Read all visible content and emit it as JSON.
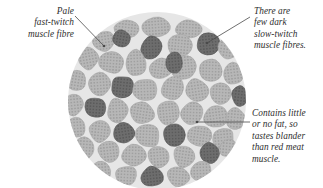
{
  "figure": {
    "kind": "micrograph-diagram",
    "background_color": "#ffffff"
  },
  "annotations": {
    "pale_fibre": {
      "text": "Pale\nfast-twitch\nmuscle fibre",
      "align": "right"
    },
    "dark_fibre": {
      "text": "There are\nfew dark\nslow-twitch\nmuscle fibres.",
      "align": "left"
    },
    "fat_content": {
      "text": "Contains little\nor no fat, so\ntastes blander\nthan red meat\nmuscle.",
      "align": "left"
    }
  },
  "leaders": [
    {
      "name": "leader-pale-fibre",
      "x1": 75,
      "y1": 16,
      "x2": 104,
      "y2": 46,
      "dot_x": 104,
      "dot_y": 46
    },
    {
      "name": "leader-dark-fibre",
      "x1": 250,
      "y1": 17,
      "x2": 207,
      "y2": 43,
      "dot_x": 207,
      "dot_y": 43
    },
    {
      "name": "leader-fat-content",
      "x1": 250,
      "y1": 122,
      "x2": 197,
      "y2": 122,
      "dot_x": 197,
      "dot_y": 122
    }
  ],
  "colors": {
    "cell_light_fill": "#b7b7b7",
    "cell_light_stipple": "#9b9b9b",
    "cell_dark_fill": "#6d6d6d",
    "cell_dark_stipple": "#565656",
    "interstitial": "#e6e6e6",
    "leader_line": "#4a4a4a",
    "text": "#2e2e2e"
  },
  "circle": {
    "cx": 157,
    "cy": 101,
    "r": 89
  },
  "chart_data": {
    "type": "scatter",
    "xlabel": "",
    "ylabel": "",
    "legend": [
      "pale fast-twitch fibre",
      "dark slow-twitch fibre"
    ],
    "counts": {
      "pale_fast_twitch": 78,
      "dark_slow_twitch": 13
    },
    "cells": [
      {
        "cx": 157,
        "cy": 26,
        "rx": 15,
        "ry": 11,
        "type": "light",
        "rot": -4
      },
      {
        "cx": 127,
        "cy": 29,
        "rx": 13,
        "ry": 10,
        "type": "light",
        "rot": 6
      },
      {
        "cx": 188,
        "cy": 29,
        "rx": 14,
        "ry": 10,
        "type": "light",
        "rot": 3
      },
      {
        "cx": 104,
        "cy": 41,
        "rx": 12,
        "ry": 11,
        "type": "light",
        "rot": -8
      },
      {
        "cx": 122,
        "cy": 38,
        "rx": 10,
        "ry": 9,
        "type": "dark",
        "rot": 10
      },
      {
        "cx": 151,
        "cy": 48,
        "rx": 11,
        "ry": 13,
        "type": "dark",
        "rot": -2
      },
      {
        "cx": 180,
        "cy": 45,
        "rx": 14,
        "ry": 12,
        "type": "light",
        "rot": 5
      },
      {
        "cx": 208,
        "cy": 44,
        "rx": 12,
        "ry": 12,
        "type": "dark",
        "rot": -6
      },
      {
        "cx": 229,
        "cy": 48,
        "rx": 13,
        "ry": 12,
        "type": "light",
        "rot": 8
      },
      {
        "cx": 88,
        "cy": 58,
        "rx": 12,
        "ry": 12,
        "type": "light",
        "rot": -10
      },
      {
        "cx": 112,
        "cy": 62,
        "rx": 13,
        "ry": 13,
        "type": "light",
        "rot": 4
      },
      {
        "cx": 136,
        "cy": 63,
        "rx": 11,
        "ry": 14,
        "type": "light",
        "rot": -3
      },
      {
        "cx": 160,
        "cy": 69,
        "rx": 12,
        "ry": 12,
        "type": "light",
        "rot": 7
      },
      {
        "cx": 184,
        "cy": 68,
        "rx": 13,
        "ry": 13,
        "type": "light",
        "rot": -5
      },
      {
        "cx": 211,
        "cy": 70,
        "rx": 13,
        "ry": 13,
        "type": "light",
        "rot": 2
      },
      {
        "cx": 233,
        "cy": 74,
        "rx": 11,
        "ry": 12,
        "type": "light",
        "rot": -7
      },
      {
        "cx": 77,
        "cy": 81,
        "rx": 11,
        "ry": 12,
        "type": "light",
        "rot": 9
      },
      {
        "cx": 99,
        "cy": 84,
        "rx": 12,
        "ry": 13,
        "type": "light",
        "rot": -4
      },
      {
        "cx": 122,
        "cy": 87,
        "rx": 12,
        "ry": 12,
        "type": "dark",
        "rot": 6
      },
      {
        "cx": 146,
        "cy": 90,
        "rx": 13,
        "ry": 12,
        "type": "light",
        "rot": -2
      },
      {
        "cx": 172,
        "cy": 88,
        "rx": 12,
        "ry": 14,
        "type": "light",
        "rot": 5
      },
      {
        "cx": 174,
        "cy": 63,
        "rx": 9,
        "ry": 11,
        "type": "dark",
        "rot": -5
      },
      {
        "cx": 197,
        "cy": 90,
        "rx": 13,
        "ry": 12,
        "type": "light",
        "rot": -8
      },
      {
        "cx": 221,
        "cy": 94,
        "rx": 12,
        "ry": 12,
        "type": "light",
        "rot": 3
      },
      {
        "cx": 240,
        "cy": 96,
        "rx": 9,
        "ry": 11,
        "type": "dark",
        "rot": 7
      },
      {
        "cx": 73,
        "cy": 104,
        "rx": 11,
        "ry": 12,
        "type": "light",
        "rot": -6
      },
      {
        "cx": 95,
        "cy": 108,
        "rx": 11,
        "ry": 11,
        "type": "dark",
        "rot": 4
      },
      {
        "cx": 118,
        "cy": 110,
        "rx": 12,
        "ry": 13,
        "type": "light",
        "rot": -3
      },
      {
        "cx": 142,
        "cy": 113,
        "rx": 13,
        "ry": 13,
        "type": "light",
        "rot": 8
      },
      {
        "cx": 168,
        "cy": 112,
        "rx": 12,
        "ry": 13,
        "type": "light",
        "rot": -5
      },
      {
        "cx": 192,
        "cy": 114,
        "rx": 12,
        "ry": 13,
        "type": "light",
        "rot": 2
      },
      {
        "cx": 215,
        "cy": 117,
        "rx": 13,
        "ry": 12,
        "type": "light",
        "rot": -7
      },
      {
        "cx": 236,
        "cy": 119,
        "rx": 10,
        "ry": 12,
        "type": "light",
        "rot": 5
      },
      {
        "cx": 76,
        "cy": 127,
        "rx": 11,
        "ry": 12,
        "type": "light",
        "rot": -4
      },
      {
        "cx": 100,
        "cy": 131,
        "rx": 12,
        "ry": 12,
        "type": "light",
        "rot": 6
      },
      {
        "cx": 124,
        "cy": 133,
        "rx": 12,
        "ry": 12,
        "type": "dark",
        "rot": -9
      },
      {
        "cx": 148,
        "cy": 136,
        "rx": 13,
        "ry": 12,
        "type": "light",
        "rot": 3
      },
      {
        "cx": 174,
        "cy": 134,
        "rx": 12,
        "ry": 13,
        "type": "dark",
        "rot": -2
      },
      {
        "cx": 199,
        "cy": 136,
        "rx": 13,
        "ry": 12,
        "type": "light",
        "rot": 7
      },
      {
        "cx": 223,
        "cy": 139,
        "rx": 12,
        "ry": 12,
        "type": "light",
        "rot": -5
      },
      {
        "cx": 85,
        "cy": 149,
        "rx": 11,
        "ry": 12,
        "type": "light",
        "rot": 4
      },
      {
        "cx": 109,
        "cy": 152,
        "rx": 12,
        "ry": 12,
        "type": "light",
        "rot": -6
      },
      {
        "cx": 134,
        "cy": 155,
        "rx": 13,
        "ry": 12,
        "type": "light",
        "rot": 2
      },
      {
        "cx": 159,
        "cy": 157,
        "rx": 12,
        "ry": 12,
        "type": "light",
        "rot": -4
      },
      {
        "cx": 184,
        "cy": 156,
        "rx": 12,
        "ry": 12,
        "type": "light",
        "rot": 8
      },
      {
        "cx": 209,
        "cy": 153,
        "rx": 11,
        "ry": 11,
        "type": "dark",
        "rot": -3
      },
      {
        "cx": 228,
        "cy": 148,
        "rx": 9,
        "ry": 10,
        "type": "light",
        "rot": 5
      },
      {
        "cx": 101,
        "cy": 172,
        "rx": 11,
        "ry": 11,
        "type": "light",
        "rot": -5
      },
      {
        "cx": 126,
        "cy": 176,
        "rx": 12,
        "ry": 11,
        "type": "light",
        "rot": 3
      },
      {
        "cx": 152,
        "cy": 177,
        "rx": 12,
        "ry": 11,
        "type": "dark",
        "rot": -6
      },
      {
        "cx": 178,
        "cy": 176,
        "rx": 12,
        "ry": 11,
        "type": "light",
        "rot": 4
      },
      {
        "cx": 202,
        "cy": 172,
        "rx": 11,
        "ry": 11,
        "type": "light",
        "rot": -2
      }
    ]
  }
}
